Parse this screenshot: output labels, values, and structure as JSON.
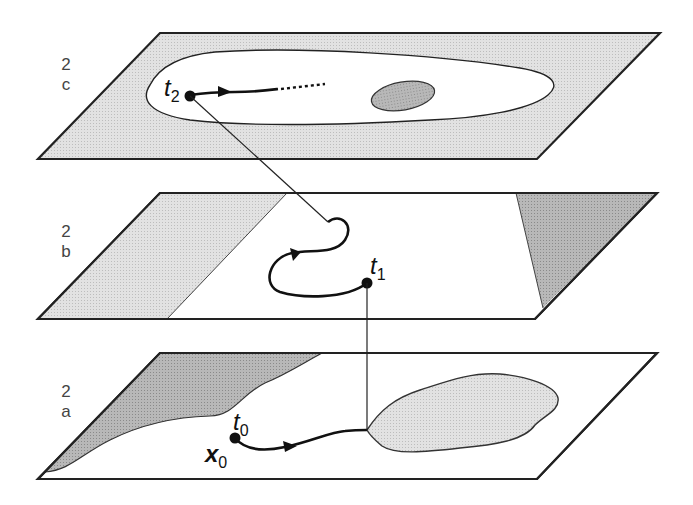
{
  "figure": {
    "colors": {
      "stroke": "#222222",
      "shade_light": "#dcdcdc",
      "shade_dark": "#b0b0b0",
      "background": "#ffffff"
    },
    "layers": [
      {
        "id": "c",
        "label_line1": "2",
        "label_line2": "c",
        "time_label": "t",
        "time_sub": "2"
      },
      {
        "id": "b",
        "label_line1": "2",
        "label_line2": "b",
        "time_label": "t",
        "time_sub": "1"
      },
      {
        "id": "a",
        "label_line1": "2",
        "label_line2": "a",
        "time_label": "t",
        "time_sub": "0",
        "state_label": "x",
        "state_sub": "0"
      }
    ]
  }
}
